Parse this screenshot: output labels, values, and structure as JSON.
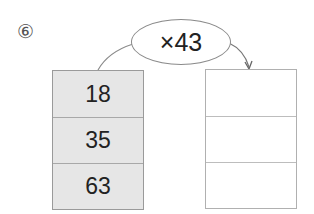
{
  "problem_number": "⑥",
  "operator": "×43",
  "left_column": {
    "values": [
      "18",
      "35",
      "63"
    ]
  },
  "right_column": {
    "values": [
      "",
      "",
      ""
    ]
  }
}
